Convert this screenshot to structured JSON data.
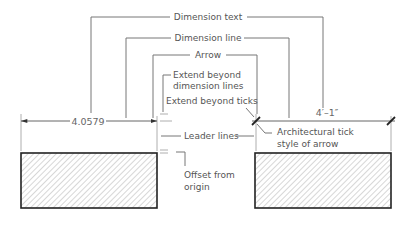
{
  "labels": {
    "dimension_text": "Dimension text",
    "dimension_line": "Dimension line",
    "arrow": "Arrow",
    "extend_beyond_dimension_lines_1": "Extend beyond",
    "extend_beyond_dimension_lines_2": "dimension lines",
    "extend_beyond_ticks": "Extend beyond ticks",
    "leader_lines": "Leader lines",
    "offset_from_origin_1": "Offset from",
    "offset_from_origin_2": "origin",
    "architectural_tick_1": "Architectural tick",
    "architectural_tick_2": "style of arrow"
  },
  "dimensions": {
    "left_value": "4.0579",
    "right_value": "4′–1″"
  },
  "colors": {
    "line": "#777777",
    "text": "#555555",
    "outline": "#222222"
  }
}
